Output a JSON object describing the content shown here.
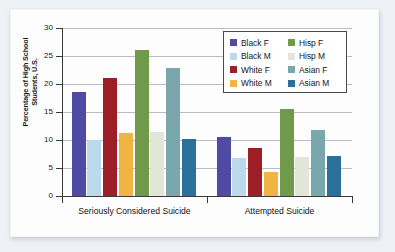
{
  "chart_data": {
    "type": "bar",
    "title": "",
    "subtitle": "",
    "xlabel": "",
    "ylabel": "Percentage of High School Students, U.S.",
    "ylabel_line1": "Percentage of High School",
    "ylabel_line2": "Students, U.S.",
    "categories": [
      "Seriously Considered Suicide",
      "Attempted Suicide"
    ],
    "ylim": [
      0,
      30
    ],
    "yticks": [
      0,
      5,
      10,
      15,
      20,
      25,
      30
    ],
    "ytick_labels": [
      "0",
      "5",
      "10",
      "15",
      "20",
      "25",
      "30"
    ],
    "grid": true,
    "grid_axis": "y",
    "legend_position": "top-right",
    "series": [
      {
        "name": "Black F",
        "color": "#4f4ba3",
        "values": [
          18.5,
          10.6
        ]
      },
      {
        "name": "Black M",
        "color": "#bcd9ec",
        "values": [
          10.0,
          6.8
        ]
      },
      {
        "name": "White F",
        "color": "#9d1f26",
        "values": [
          21.0,
          8.5
        ]
      },
      {
        "name": "White M",
        "color": "#f2b345",
        "values": [
          11.3,
          4.2
        ]
      },
      {
        "name": "Hisp F",
        "color": "#71994a",
        "values": [
          26.0,
          15.6
        ]
      },
      {
        "name": "Hisp M",
        "color": "#e1e6d6",
        "values": [
          11.4,
          6.9
        ]
      },
      {
        "name": "Asian F",
        "color": "#7aa7ab",
        "values": [
          22.9,
          11.8
        ]
      },
      {
        "name": "Asian M",
        "color": "#2b6f9b",
        "values": [
          10.2,
          7.2
        ]
      }
    ]
  },
  "legend": {
    "columns": [
      [
        "Black F",
        "Black M",
        "White F",
        "White M"
      ],
      [
        "Hisp F",
        "Hisp M",
        "Asian F",
        "Asian M"
      ]
    ]
  }
}
